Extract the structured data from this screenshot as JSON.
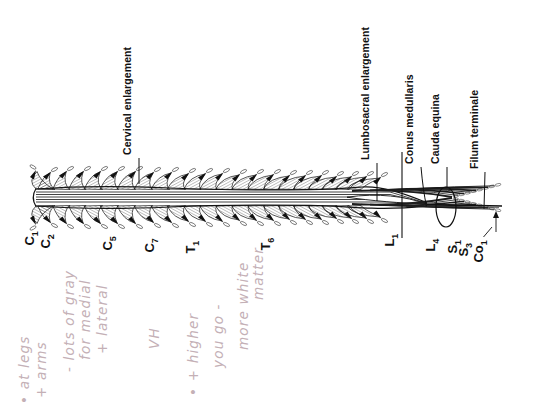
{
  "figure": {
    "description_labels": [
      {
        "id": "cervical-enlargement",
        "text": "Cervical enlargement",
        "x": 139,
        "y_bottom": 155,
        "leader": {
          "type": "line",
          "x1": 139,
          "y1": 158,
          "x2": 139,
          "y2": 184
        }
      },
      {
        "id": "lumbosacral-enlargement",
        "text": "Lumbosacral enlargement",
        "x": 377,
        "y_bottom": 160,
        "leader": {
          "type": "line",
          "x1": 377,
          "y1": 163,
          "x2": 377,
          "y2": 201
        }
      },
      {
        "id": "conus-medullaris",
        "text": "Conus medullaris",
        "x": 421,
        "y_bottom": 164,
        "leader": {
          "type": "curve",
          "d": "M421,167 Q423,190 426.5,206.5"
        }
      },
      {
        "id": "cauda-equina",
        "text": "Cauda equina",
        "x": 447,
        "y_bottom": 164,
        "leader": {
          "type": "line",
          "x1": 447,
          "y1": 167,
          "x2": 447,
          "y2": 188
        }
      },
      {
        "id": "filum-terminale",
        "text": "Filum terminale",
        "x": 486,
        "y_bottom": 169,
        "leader": {
          "type": "line",
          "x1": 485,
          "y1": 172,
          "x2": 484,
          "y2": 209
        }
      }
    ],
    "level_labels": [
      {
        "id": "c1",
        "letter": "C",
        "sub": "1",
        "x": 47,
        "y_bottom": 242
      },
      {
        "id": "c2",
        "letter": "C",
        "sub": "2",
        "x": 63,
        "y_bottom": 245
      },
      {
        "id": "c5",
        "letter": "C",
        "sub": "5",
        "x": 125,
        "y_bottom": 247
      },
      {
        "id": "c7",
        "letter": "C",
        "sub": "7",
        "x": 167,
        "y_bottom": 249
      },
      {
        "id": "t1",
        "letter": "T",
        "sub": "1",
        "x": 208,
        "y_bottom": 250
      },
      {
        "id": "t6",
        "letter": "T",
        "sub": "6",
        "x": 283,
        "y_bottom": 247
      },
      {
        "id": "l1",
        "letter": "L",
        "sub": "1",
        "x": 407,
        "y_bottom": 243
      },
      {
        "id": "l4",
        "letter": "L",
        "sub": "4",
        "x": 448,
        "y_bottom": 248
      },
      {
        "id": "s1",
        "letter": "S",
        "sub": "1",
        "x": 470,
        "y_bottom": 250
      },
      {
        "id": "s3",
        "letter": "S",
        "sub": "3",
        "x": 481,
        "y_bottom": 253
      },
      {
        "id": "co1",
        "letter": "Co",
        "sub": "1",
        "x": 496,
        "y_bottom": 259
      }
    ],
    "cord": {
      "center_y": 197.5,
      "top_edge_y": 189,
      "bottom_edge_y": 206,
      "start_x": 36,
      "conus_tip": [
        427,
        204.5
      ],
      "filum_end": [
        502,
        206
      ],
      "fans": [
        [
          46,
          4,
          16,
          15
        ],
        [
          61,
          5,
          17,
          15
        ],
        [
          77,
          6,
          17,
          15
        ],
        [
          93,
          7,
          17,
          16
        ],
        [
          109,
          8,
          17,
          16
        ],
        [
          126,
          9,
          17,
          16
        ],
        [
          143,
          10,
          16,
          16
        ],
        [
          160,
          11,
          16,
          16
        ],
        [
          176,
          12,
          15,
          16
        ],
        [
          192,
          13,
          15,
          15
        ],
        [
          208,
          14,
          15,
          15
        ],
        [
          224,
          15,
          14,
          15
        ],
        [
          240,
          16,
          14,
          15
        ],
        [
          256,
          17,
          14,
          15
        ],
        [
          271,
          18,
          13,
          14
        ],
        [
          286,
          19,
          13,
          14
        ],
        [
          301,
          20,
          13,
          14
        ],
        [
          315,
          21,
          12,
          13
        ],
        [
          329,
          22,
          12,
          13
        ],
        [
          342,
          24,
          12,
          12
        ],
        [
          354,
          26,
          11,
          12
        ]
      ],
      "cauda_fibers": [
        {
          "sx": 352,
          "sy": 191.0,
          "ex": 452,
          "ey": 197.0,
          "w": 1.8
        },
        {
          "sx": 361,
          "sy": 190.7,
          "ex": 458,
          "ey": 195.4,
          "w": 0.8
        },
        {
          "sx": 370,
          "sy": 190.4,
          "ex": 464,
          "ey": 193.8,
          "w": 1.6
        },
        {
          "sx": 379,
          "sy": 190.1,
          "ex": 470,
          "ey": 192.2,
          "w": 0.9
        },
        {
          "sx": 388,
          "sy": 189.8,
          "ex": 476,
          "ey": 190.6,
          "w": 1.8
        },
        {
          "sx": 397,
          "sy": 189.5,
          "ex": 482,
          "ey": 189.0,
          "w": 0.8
        },
        {
          "sx": 406,
          "sy": 189.2,
          "ex": 488,
          "ey": 187.4,
          "w": 1.4
        },
        {
          "sx": 415,
          "sy": 188.9,
          "ex": 494,
          "ey": 185.8,
          "w": 0.9
        }
      ],
      "ellipse": {
        "cx": 446,
        "cy": 207,
        "rx": 10,
        "ry": 20
      },
      "l1_level_line": {
        "x": 402,
        "y1": 152,
        "y2": 238
      },
      "s3_leader": {
        "x1": 483.5,
        "y1": 237,
        "x2": 492,
        "y2": 227
      },
      "co1_arrow": {
        "x": 496,
        "y1": 232,
        "y2": 216
      }
    },
    "ink_color": "#111111"
  },
  "handwriting": {
    "color": "#c4b0b6",
    "lines": [
      {
        "text": "• at legs",
        "x": 38,
        "y_bottom": 404
      },
      {
        "text": "+ arms",
        "x": 55,
        "y_bottom": 398
      },
      {
        "text": "- lots of gray",
        "x": 83,
        "y_bottom": 372
      },
      {
        "text": "for medial",
        "x": 99,
        "y_bottom": 360
      },
      {
        "text": "+ lateral",
        "x": 116,
        "y_bottom": 354
      },
      {
        "text": "VH",
        "x": 168,
        "y_bottom": 349
      },
      {
        "text": "• + higher",
        "x": 207,
        "y_bottom": 396
      },
      {
        "text": "you go -",
        "x": 232,
        "y_bottom": 368
      },
      {
        "text": "more white",
        "x": 257,
        "y_bottom": 350
      },
      {
        "text": "matter",
        "x": 272,
        "y_bottom": 300
      }
    ]
  }
}
